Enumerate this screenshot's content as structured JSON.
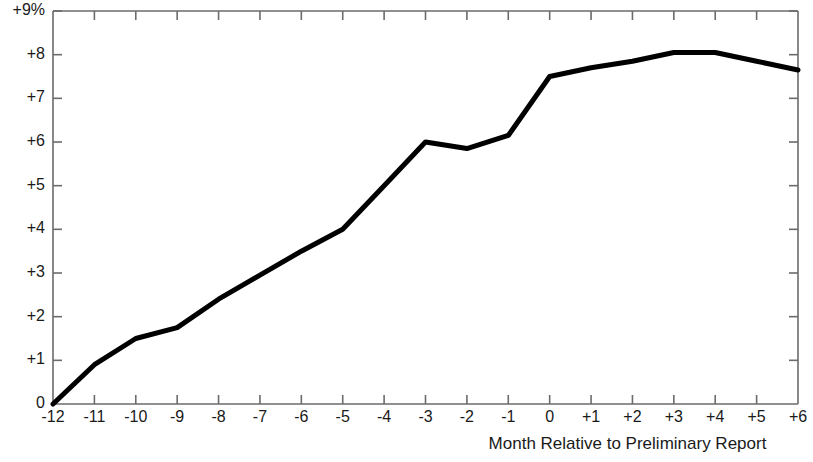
{
  "chart_data": {
    "type": "line",
    "title": "",
    "subtitle": "",
    "xlabel": "Month Relative to Preliminary Report",
    "ylabel": "",
    "x": [
      -12,
      -11,
      -10,
      -9,
      -8,
      -7,
      -6,
      -5,
      -4,
      -3,
      -2,
      -1,
      0,
      1,
      2,
      3,
      4,
      5,
      6
    ],
    "categories": [
      "-12",
      "-11",
      "-10",
      "-9",
      "-8",
      "-7",
      "-6",
      "-5",
      "-4",
      "-3",
      "-2",
      "-1",
      "0",
      "+1",
      "+2",
      "+3",
      "+4",
      "+5",
      "+6"
    ],
    "values": [
      0,
      0.9,
      1.5,
      1.75,
      2.4,
      2.95,
      3.5,
      4.0,
      5.0,
      6.0,
      5.85,
      6.15,
      7.5,
      7.7,
      7.85,
      8.05,
      8.05,
      7.85,
      7.65
    ],
    "series": [
      {
        "name": "Cumulative Average Residual",
        "values": [
          0,
          0.9,
          1.5,
          1.75,
          2.4,
          2.95,
          3.5,
          4.0,
          5.0,
          6.0,
          5.85,
          6.15,
          7.5,
          7.7,
          7.85,
          8.05,
          8.05,
          7.85,
          7.65
        ],
        "color": "#000000"
      }
    ],
    "xlim": [
      -12,
      6
    ],
    "ylim": [
      0,
      9
    ],
    "xticks": [
      -12,
      -11,
      -10,
      -9,
      -8,
      -7,
      -6,
      -5,
      -4,
      -3,
      -2,
      -1,
      0,
      1,
      2,
      3,
      4,
      5,
      6
    ],
    "xtick_labels": [
      "-12",
      "-11",
      "-10",
      "-9",
      "-8",
      "-7",
      "-6",
      "-5",
      "-4",
      "-3",
      "-2",
      "-1",
      "0",
      "+1",
      "+2",
      "+3",
      "+4",
      "+5",
      "+6"
    ],
    "yticks": [
      0,
      1,
      2,
      3,
      4,
      5,
      6,
      7,
      8,
      9
    ],
    "ytick_labels": [
      "0",
      "+1",
      "+2",
      "+3",
      "+4",
      "+5",
      "+6",
      "+7",
      "+8",
      "+9%"
    ],
    "grid": false,
    "legend": null,
    "legend_position": "none",
    "line_color": "#000000",
    "line_width": 5,
    "axis_color": "#6b6b6b",
    "background_color": "#ffffff",
    "annotations": []
  }
}
